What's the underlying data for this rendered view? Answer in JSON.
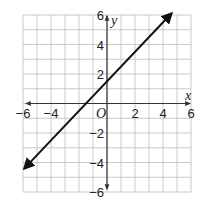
{
  "chart_data": {
    "type": "line",
    "title": "",
    "xlabel": "x",
    "ylabel": "y",
    "origin_label": "O",
    "xlim": [
      -6,
      6
    ],
    "ylim": [
      -6,
      6
    ],
    "grid": true,
    "x_ticks": [
      -6,
      -4,
      2,
      4,
      6
    ],
    "y_ticks": [
      6,
      4,
      2,
      -2,
      -4,
      -6
    ],
    "x_tick_labels": [
      "−6",
      "−4",
      "2",
      "4",
      "6"
    ],
    "y_tick_labels": [
      "6",
      "4",
      "2",
      "−2",
      "−4",
      "−6"
    ],
    "series": [
      {
        "name": "line",
        "equation": "y = x + 1.5",
        "slope": 1,
        "intercept": 1.5,
        "x": [
          -5.9,
          4.6
        ],
        "y": [
          -4.4,
          6.1
        ],
        "arrows": "both",
        "color": "#111111"
      }
    ],
    "legend": null
  }
}
